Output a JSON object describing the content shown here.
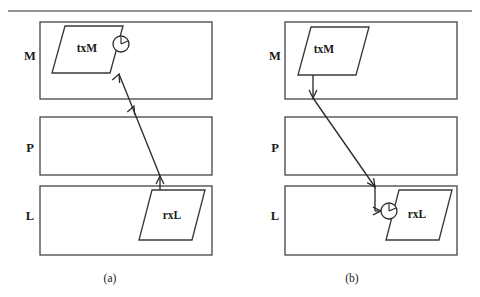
{
  "figure": {
    "background_color": "#ffffff",
    "line_color": "#2b2b2b",
    "box_stroke_color": "#4a4a4a",
    "top_rule": {
      "x1": 8,
      "y1": 11,
      "x2": 472,
      "y2": 11
    }
  },
  "panels": [
    {
      "id": "a",
      "caption": "(a)",
      "caption_x": 110,
      "caption_y": 279,
      "rows": [
        {
          "key": "M",
          "label": "M",
          "label_x": 30,
          "label_y": 57,
          "x": 40,
          "y": 22,
          "width": 172,
          "height": 77
        },
        {
          "key": "P",
          "label": "P",
          "label_x": 30,
          "label_y": 149,
          "x": 40,
          "y": 117,
          "width": 172,
          "height": 58
        },
        {
          "key": "L",
          "label": "L",
          "label_x": 30,
          "label_y": 217,
          "x": 40,
          "y": 186,
          "width": 172,
          "height": 69
        }
      ],
      "nodes": [
        {
          "name": "txM",
          "label": "txM",
          "label_x": 87,
          "label_y": 49,
          "points": "65,26 123,26 110,73 52,73"
        },
        {
          "name": "rxL",
          "label": "rxL",
          "label_x": 172,
          "label_y": 216,
          "points": "152,190 205,190 192,240 139,240"
        }
      ],
      "clock": {
        "present": true,
        "attached_to": "txM",
        "cx": 121,
        "cy": 44,
        "r": 8,
        "hands": [
          {
            "x1": 121,
            "y1": 44,
            "x2": 121,
            "y2": 37
          },
          {
            "x1": 121,
            "y1": 44,
            "x2": 128,
            "y2": 41
          }
        ]
      },
      "flow": {
        "description": "diagonal arrow from rxL upward to txM",
        "segments": [
          {
            "x1": 160,
            "y1": 190,
            "x2": 160,
            "y2": 176
          },
          {
            "x1": 160,
            "y1": 176,
            "x2": 119,
            "y2": 74
          }
        ],
        "arrowheads": [
          {
            "x": 160,
            "y": 176,
            "angle": -90
          },
          {
            "x": 134,
            "y": 106,
            "angle": -68
          },
          {
            "x": 119,
            "y": 74,
            "angle": -68
          }
        ]
      }
    },
    {
      "id": "b",
      "caption": "(b)",
      "caption_x": 352,
      "caption_y": 279,
      "rows": [
        {
          "key": "M",
          "label": "M",
          "label_x": 275,
          "label_y": 57,
          "x": 285,
          "y": 22,
          "width": 172,
          "height": 77
        },
        {
          "key": "P",
          "label": "P",
          "label_x": 275,
          "label_y": 149,
          "x": 285,
          "y": 117,
          "width": 172,
          "height": 58
        },
        {
          "key": "L",
          "label": "L",
          "label_x": 275,
          "label_y": 217,
          "x": 285,
          "y": 186,
          "width": 172,
          "height": 69
        }
      ],
      "nodes": [
        {
          "name": "txM",
          "label": "txM",
          "label_x": 324,
          "label_y": 50,
          "points": "311,27 369,27 356,75 298,75"
        },
        {
          "name": "rxL",
          "label": "rxL",
          "label_x": 417,
          "label_y": 215,
          "points": "399,190 452,190 439,240 386,240"
        }
      ],
      "clock": {
        "present": true,
        "attached_to": "rxL",
        "cx": 389,
        "cy": 211,
        "r": 8,
        "hands": [
          {
            "x1": 389,
            "y1": 211,
            "x2": 389,
            "y2": 204
          },
          {
            "x1": 389,
            "y1": 211,
            "x2": 396,
            "y2": 208
          }
        ]
      },
      "flow": {
        "description": "arrow from txM bottom down through P into rxL clock",
        "segments": [
          {
            "x1": 313,
            "y1": 75,
            "x2": 313,
            "y2": 98
          },
          {
            "x1": 313,
            "y1": 98,
            "x2": 375,
            "y2": 187
          },
          {
            "x1": 375,
            "y1": 187,
            "x2": 375,
            "y2": 211
          },
          {
            "x1": 375,
            "y1": 211,
            "x2": 381,
            "y2": 211
          }
        ],
        "arrowheads": [
          {
            "x": 313,
            "y": 98,
            "angle": 90
          },
          {
            "x": 375,
            "y": 187,
            "angle": 55
          },
          {
            "x": 381,
            "y": 211,
            "angle": 0
          }
        ]
      }
    }
  ]
}
